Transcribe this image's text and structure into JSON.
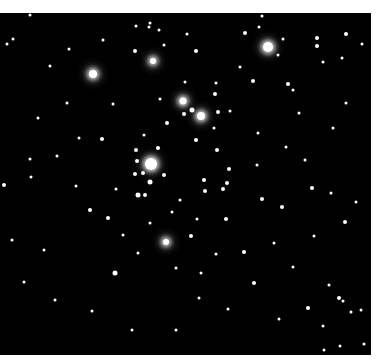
{
  "image": {
    "subject": "open star cluster",
    "background_color": "#000000",
    "border_color": "#ffffff",
    "field": {
      "x": 0,
      "y": 13,
      "width": 371,
      "height": 342
    }
  },
  "stars": [
    {
      "x": 268,
      "y": 47,
      "r": 5,
      "g": 1
    },
    {
      "x": 93,
      "y": 74,
      "r": 4,
      "g": 1
    },
    {
      "x": 151,
      "y": 164,
      "r": 6,
      "g": 1
    },
    {
      "x": 201,
      "y": 116,
      "r": 4,
      "g": 1
    },
    {
      "x": 183,
      "y": 101,
      "r": 3.5,
      "g": 1
    },
    {
      "x": 153,
      "y": 61,
      "r": 3,
      "g": 1
    },
    {
      "x": 150,
      "y": 182,
      "r": 2.5,
      "g": 0
    },
    {
      "x": 166,
      "y": 242,
      "r": 3,
      "g": 1
    },
    {
      "x": 115,
      "y": 273,
      "r": 2.5,
      "g": 0
    },
    {
      "x": 192,
      "y": 110,
      "r": 2.5,
      "g": 0
    },
    {
      "x": 136,
      "y": 150,
      "r": 2,
      "g": 0
    },
    {
      "x": 158,
      "y": 148,
      "r": 2,
      "g": 0
    },
    {
      "x": 137,
      "y": 161,
      "r": 2,
      "g": 0
    },
    {
      "x": 143,
      "y": 173,
      "r": 2,
      "g": 0
    },
    {
      "x": 138,
      "y": 195,
      "r": 2.5,
      "g": 0
    },
    {
      "x": 135,
      "y": 174,
      "r": 2,
      "g": 0
    },
    {
      "x": 145,
      "y": 195,
      "r": 2,
      "g": 0
    },
    {
      "x": 164,
      "y": 175,
      "r": 2,
      "g": 0
    },
    {
      "x": 196,
      "y": 140,
      "r": 2,
      "g": 0
    },
    {
      "x": 217,
      "y": 150,
      "r": 2,
      "g": 0
    },
    {
      "x": 229,
      "y": 169,
      "r": 2,
      "g": 0
    },
    {
      "x": 204,
      "y": 180,
      "r": 2,
      "g": 0
    },
    {
      "x": 223,
      "y": 189,
      "r": 2,
      "g": 0
    },
    {
      "x": 227,
      "y": 183,
      "r": 2,
      "g": 0
    },
    {
      "x": 205,
      "y": 191,
      "r": 2,
      "g": 0
    },
    {
      "x": 218,
      "y": 112,
      "r": 2,
      "g": 0
    },
    {
      "x": 215,
      "y": 94,
      "r": 2,
      "g": 0
    },
    {
      "x": 216,
      "y": 83,
      "r": 1.5,
      "g": 0
    },
    {
      "x": 167,
      "y": 123,
      "r": 2,
      "g": 0
    },
    {
      "x": 144,
      "y": 135,
      "r": 1.5,
      "g": 0
    },
    {
      "x": 184,
      "y": 114,
      "r": 2,
      "g": 0
    },
    {
      "x": 214,
      "y": 128,
      "r": 1.5,
      "g": 0
    },
    {
      "x": 230,
      "y": 111,
      "r": 1.5,
      "g": 0
    },
    {
      "x": 245,
      "y": 33,
      "r": 2,
      "g": 0
    },
    {
      "x": 259,
      "y": 27,
      "r": 1.5,
      "g": 0
    },
    {
      "x": 262,
      "y": 16,
      "r": 1.5,
      "g": 0
    },
    {
      "x": 278,
      "y": 55,
      "r": 1.5,
      "g": 0
    },
    {
      "x": 253,
      "y": 81,
      "r": 2,
      "g": 0
    },
    {
      "x": 288,
      "y": 84,
      "r": 2,
      "g": 0
    },
    {
      "x": 293,
      "y": 90,
      "r": 1.5,
      "g": 0
    },
    {
      "x": 317,
      "y": 38,
      "r": 2,
      "g": 0
    },
    {
      "x": 317,
      "y": 46,
      "r": 2,
      "g": 0
    },
    {
      "x": 283,
      "y": 39,
      "r": 1.5,
      "g": 0
    },
    {
      "x": 346,
      "y": 34,
      "r": 2,
      "g": 0
    },
    {
      "x": 362,
      "y": 44,
      "r": 1.5,
      "g": 0
    },
    {
      "x": 323,
      "y": 62,
      "r": 1.5,
      "g": 0
    },
    {
      "x": 342,
      "y": 58,
      "r": 1.5,
      "g": 0
    },
    {
      "x": 149,
      "y": 27,
      "r": 1.5,
      "g": 0
    },
    {
      "x": 150,
      "y": 23,
      "r": 1.5,
      "g": 0
    },
    {
      "x": 136,
      "y": 26,
      "r": 1.5,
      "g": 0
    },
    {
      "x": 159,
      "y": 30,
      "r": 1.5,
      "g": 0
    },
    {
      "x": 187,
      "y": 34,
      "r": 1.5,
      "g": 0
    },
    {
      "x": 196,
      "y": 51,
      "r": 2,
      "g": 0
    },
    {
      "x": 135,
      "y": 51,
      "r": 2,
      "g": 0
    },
    {
      "x": 164,
      "y": 45,
      "r": 1.5,
      "g": 0
    },
    {
      "x": 103,
      "y": 40,
      "r": 1.5,
      "g": 0
    },
    {
      "x": 69,
      "y": 49,
      "r": 1.5,
      "g": 0
    },
    {
      "x": 50,
      "y": 66,
      "r": 1.5,
      "g": 0
    },
    {
      "x": 30,
      "y": 15,
      "r": 1.5,
      "g": 0
    },
    {
      "x": 7,
      "y": 44,
      "r": 1.5,
      "g": 0
    },
    {
      "x": 13,
      "y": 39,
      "r": 1.5,
      "g": 0
    },
    {
      "x": 102,
      "y": 139,
      "r": 2,
      "g": 0
    },
    {
      "x": 79,
      "y": 138,
      "r": 1.5,
      "g": 0
    },
    {
      "x": 57,
      "y": 156,
      "r": 1.5,
      "g": 0
    },
    {
      "x": 30,
      "y": 159,
      "r": 1.5,
      "g": 0
    },
    {
      "x": 31,
      "y": 177,
      "r": 1.5,
      "g": 0
    },
    {
      "x": 4,
      "y": 185,
      "r": 2,
      "g": 0
    },
    {
      "x": 90,
      "y": 210,
      "r": 2,
      "g": 0
    },
    {
      "x": 108,
      "y": 218,
      "r": 2,
      "g": 0
    },
    {
      "x": 123,
      "y": 235,
      "r": 1.5,
      "g": 0
    },
    {
      "x": 191,
      "y": 236,
      "r": 2,
      "g": 0
    },
    {
      "x": 226,
      "y": 219,
      "r": 2,
      "g": 0
    },
    {
      "x": 262,
      "y": 199,
      "r": 2,
      "g": 0
    },
    {
      "x": 282,
      "y": 207,
      "r": 2,
      "g": 0
    },
    {
      "x": 312,
      "y": 188,
      "r": 2,
      "g": 0
    },
    {
      "x": 331,
      "y": 193,
      "r": 1.5,
      "g": 0
    },
    {
      "x": 345,
      "y": 222,
      "r": 2,
      "g": 0
    },
    {
      "x": 356,
      "y": 202,
      "r": 1.5,
      "g": 0
    },
    {
      "x": 305,
      "y": 160,
      "r": 1.5,
      "g": 0
    },
    {
      "x": 286,
      "y": 147,
      "r": 1.5,
      "g": 0
    },
    {
      "x": 333,
      "y": 128,
      "r": 1.5,
      "g": 0
    },
    {
      "x": 346,
      "y": 103,
      "r": 1.5,
      "g": 0
    },
    {
      "x": 258,
      "y": 133,
      "r": 1.5,
      "g": 0
    },
    {
      "x": 244,
      "y": 252,
      "r": 2,
      "g": 0
    },
    {
      "x": 216,
      "y": 254,
      "r": 1.5,
      "g": 0
    },
    {
      "x": 201,
      "y": 273,
      "r": 1.5,
      "g": 0
    },
    {
      "x": 254,
      "y": 283,
      "r": 2,
      "g": 0
    },
    {
      "x": 339,
      "y": 298,
      "r": 2,
      "g": 0
    },
    {
      "x": 343,
      "y": 301,
      "r": 1.5,
      "g": 0
    },
    {
      "x": 308,
      "y": 308,
      "r": 2,
      "g": 0
    },
    {
      "x": 351,
      "y": 312,
      "r": 1.5,
      "g": 0
    },
    {
      "x": 361,
      "y": 310,
      "r": 1.5,
      "g": 0
    },
    {
      "x": 323,
      "y": 326,
      "r": 1.5,
      "g": 0
    },
    {
      "x": 364,
      "y": 344,
      "r": 1.5,
      "g": 0
    },
    {
      "x": 324,
      "y": 350,
      "r": 1.5,
      "g": 0
    },
    {
      "x": 340,
      "y": 346,
      "r": 1.5,
      "g": 0
    },
    {
      "x": 329,
      "y": 285,
      "r": 1.5,
      "g": 0
    },
    {
      "x": 279,
      "y": 319,
      "r": 1.5,
      "g": 0
    },
    {
      "x": 228,
      "y": 309,
      "r": 1.5,
      "g": 0
    },
    {
      "x": 176,
      "y": 330,
      "r": 1.5,
      "g": 0
    },
    {
      "x": 132,
      "y": 330,
      "r": 1.5,
      "g": 0
    },
    {
      "x": 92,
      "y": 311,
      "r": 1.5,
      "g": 0
    },
    {
      "x": 55,
      "y": 300,
      "r": 1.5,
      "g": 0
    },
    {
      "x": 24,
      "y": 282,
      "r": 1.5,
      "g": 0
    },
    {
      "x": 44,
      "y": 250,
      "r": 1.5,
      "g": 0
    },
    {
      "x": 12,
      "y": 240,
      "r": 1.5,
      "g": 0
    },
    {
      "x": 76,
      "y": 186,
      "r": 1.5,
      "g": 0
    },
    {
      "x": 116,
      "y": 189,
      "r": 1.5,
      "g": 0
    },
    {
      "x": 113,
      "y": 104,
      "r": 1.5,
      "g": 0
    },
    {
      "x": 67,
      "y": 103,
      "r": 1.5,
      "g": 0
    },
    {
      "x": 38,
      "y": 118,
      "r": 1.5,
      "g": 0
    },
    {
      "x": 185,
      "y": 82,
      "r": 1.5,
      "g": 0
    },
    {
      "x": 160,
      "y": 99,
      "r": 1.5,
      "g": 0
    },
    {
      "x": 240,
      "y": 67,
      "r": 1.5,
      "g": 0
    },
    {
      "x": 299,
      "y": 113,
      "r": 1.5,
      "g": 0
    },
    {
      "x": 257,
      "y": 165,
      "r": 1.5,
      "g": 0
    },
    {
      "x": 180,
      "y": 200,
      "r": 1.5,
      "g": 0
    },
    {
      "x": 172,
      "y": 212,
      "r": 1.5,
      "g": 0
    },
    {
      "x": 197,
      "y": 219,
      "r": 1.5,
      "g": 0
    },
    {
      "x": 150,
      "y": 223,
      "r": 1.5,
      "g": 0
    },
    {
      "x": 138,
      "y": 253,
      "r": 1.5,
      "g": 0
    },
    {
      "x": 176,
      "y": 268,
      "r": 1.5,
      "g": 0
    },
    {
      "x": 199,
      "y": 298,
      "r": 1.5,
      "g": 0
    },
    {
      "x": 274,
      "y": 243,
      "r": 1.5,
      "g": 0
    },
    {
      "x": 293,
      "y": 267,
      "r": 1.5,
      "g": 0
    },
    {
      "x": 314,
      "y": 236,
      "r": 1.5,
      "g": 0
    }
  ]
}
